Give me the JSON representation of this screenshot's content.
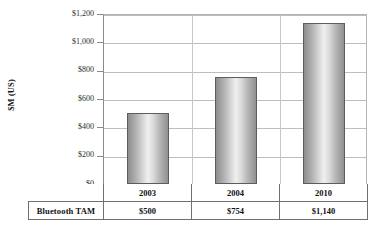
{
  "chart_data": {
    "type": "bar",
    "title": "",
    "subtitle": "",
    "xlabel": "",
    "ylabel": "$M (US)",
    "categories": [
      "2003",
      "2004",
      "2010"
    ],
    "series": [
      {
        "name": "Bluetooth TAM",
        "values": [
          500,
          754,
          1140
        ],
        "value_labels": [
          "$500",
          "$754",
          "$1,140"
        ]
      }
    ],
    "ylim": [
      0,
      1200
    ],
    "y_ticks": [
      0,
      200,
      400,
      600,
      800,
      1000,
      1200
    ],
    "y_tick_labels": [
      "$0",
      "$200",
      "$400",
      "$600",
      "$800",
      "$1,000",
      "$1,200"
    ],
    "grid": true,
    "grid_axis": "y",
    "legend": false,
    "legend_position": "none",
    "data_table_visible": true,
    "bar_fill": "#c8c8c8",
    "bar_border_color": "#5d5d5d",
    "gridline_color": "#bdbdbd",
    "axis_color": "#7e7e7e",
    "background_color": "#ffffff",
    "text_color": "#111111"
  },
  "axis": {
    "y_title": "$M (US)",
    "ticks": [
      {
        "label": "$1,200",
        "value": 1200
      },
      {
        "label": "$1,000",
        "value": 1000
      },
      {
        "label": "$800",
        "value": 800
      },
      {
        "label": "$600",
        "value": 600
      },
      {
        "label": "$400",
        "value": 400
      },
      {
        "label": "$200",
        "value": 200
      },
      {
        "label": "$0",
        "value": 0
      }
    ]
  },
  "table": {
    "row_header": "Bluetooth TAM",
    "years": [
      "2003",
      "2004",
      "2010"
    ],
    "values": [
      "$500",
      "$754",
      "$1,140"
    ]
  }
}
